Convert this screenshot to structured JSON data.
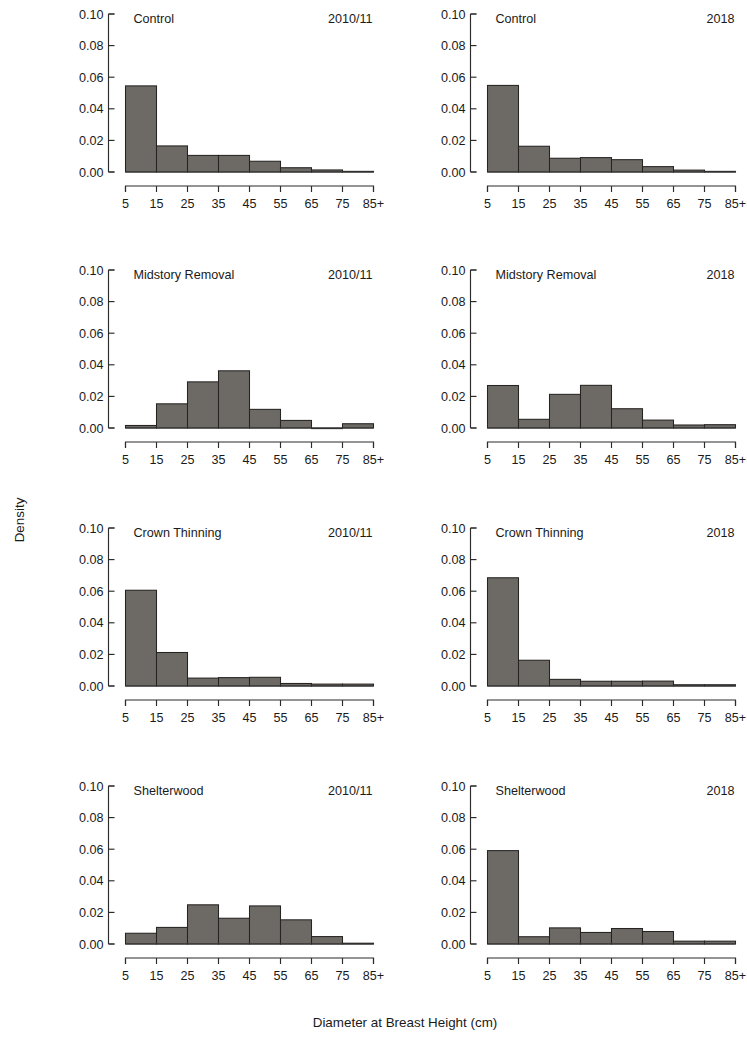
{
  "figure": {
    "xlabel": "Diameter at Breast Height (cm)",
    "ylabel": "Density",
    "bar_color": "#6d6a66",
    "bar_border_color": "#262422",
    "axis_color": "#2b2b2b"
  },
  "axes": {
    "y_ticks": [
      "0.00",
      "0.02",
      "0.04",
      "0.06",
      "0.08",
      "0.10"
    ],
    "y_values": [
      0.0,
      0.02,
      0.04,
      0.06,
      0.08,
      0.1
    ],
    "ylim": [
      0.0,
      0.1
    ],
    "x_ticks": [
      "5",
      "15",
      "25",
      "35",
      "45",
      "55",
      "65",
      "75",
      "85+"
    ],
    "x_bin_edges": [
      5,
      15,
      25,
      35,
      45,
      55,
      65,
      75,
      85
    ],
    "xlim": [
      5,
      85
    ]
  },
  "chart_data": {
    "type": "bar",
    "title": "",
    "xlabel": "Diameter at Breast Height (cm)",
    "ylabel": "Density",
    "ylim": [
      0.0,
      0.1
    ],
    "grid": false,
    "legend": "none",
    "layout": {
      "rows": 4,
      "cols": 2,
      "col_years": [
        "2010/11",
        "2018"
      ]
    },
    "categories": [
      "5-15",
      "15-25",
      "25-35",
      "35-45",
      "45-55",
      "55-65",
      "65-75",
      "75-85+"
    ],
    "panels": [
      {
        "row": 0,
        "col": 0,
        "treatment": "Control",
        "year": "2010/11",
        "values": [
          0.0545,
          0.0165,
          0.0105,
          0.0105,
          0.0068,
          0.0027,
          0.0013,
          0.0004
        ]
      },
      {
        "row": 0,
        "col": 1,
        "treatment": "Control",
        "year": "2018",
        "values": [
          0.0548,
          0.0163,
          0.0087,
          0.0091,
          0.0078,
          0.0034,
          0.0012,
          0.0004
        ]
      },
      {
        "row": 1,
        "col": 0,
        "treatment": "Midstory Removal",
        "year": "2010/11",
        "values": [
          0.0016,
          0.0153,
          0.0292,
          0.0362,
          0.0118,
          0.0048,
          0.0,
          0.0027
        ]
      },
      {
        "row": 1,
        "col": 1,
        "treatment": "Midstory Removal",
        "year": "2018",
        "values": [
          0.0269,
          0.0055,
          0.0213,
          0.027,
          0.0122,
          0.005,
          0.0019,
          0.0021
        ]
      },
      {
        "row": 2,
        "col": 0,
        "treatment": "Crown Thinning",
        "year": "2010/11",
        "values": [
          0.0606,
          0.0212,
          0.005,
          0.0053,
          0.0055,
          0.0016,
          0.0012,
          0.0012
        ]
      },
      {
        "row": 2,
        "col": 1,
        "treatment": "Crown Thinning",
        "year": "2018",
        "values": [
          0.0685,
          0.0163,
          0.0042,
          0.003,
          0.003,
          0.0031,
          0.0008,
          0.0008
        ]
      },
      {
        "row": 3,
        "col": 0,
        "treatment": "Shelterwood",
        "year": "2010/11",
        "values": [
          0.0068,
          0.0105,
          0.0248,
          0.0163,
          0.0241,
          0.0153,
          0.0047,
          0.0005
        ]
      },
      {
        "row": 3,
        "col": 1,
        "treatment": "Shelterwood",
        "year": "2018",
        "values": [
          0.0591,
          0.0046,
          0.0102,
          0.0073,
          0.0098,
          0.0079,
          0.0018,
          0.0018
        ]
      }
    ]
  }
}
